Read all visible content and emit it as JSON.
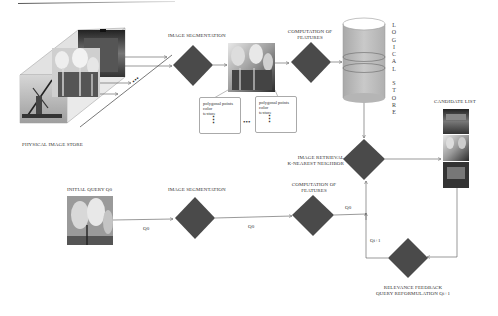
{
  "diagram": {
    "colors": {
      "diamond": "#4a4a4a",
      "cylinder": "#bdbdbd",
      "line": "#555555",
      "text": "#333333"
    },
    "physical_store": {
      "label": "PHYSICAL IMAGE STORE",
      "images": [
        "windmill-photo",
        "tulips-photo",
        "house-photo"
      ],
      "dots": "•••"
    },
    "top_row": {
      "segmentation_label": "IMAGE SEGMENTATION",
      "features_label_line1": "COMPUTATION OF",
      "features_label_line2": "FEATURES",
      "feature_boxes": [
        {
          "lines": [
            "polygonal points",
            "color",
            "texture"
          ],
          "dots": "⋮"
        },
        {
          "lines": [
            "polygonal points",
            "color",
            "texture"
          ],
          "dots": "⋮"
        }
      ],
      "between_boxes_dots": "•••"
    },
    "logical_store": {
      "letters_top": [
        "L",
        "O",
        "G",
        "I",
        "C",
        "A",
        "L"
      ],
      "letters_bottom": [
        "S",
        "T",
        "O",
        "R",
        "E"
      ]
    },
    "retrieval": {
      "label_line1": "IMAGE RETRIEVAL",
      "label_line2": "K-NEAREST NEIGHBOR"
    },
    "candidate_list": {
      "label": "CANDIDATE LIST",
      "images": [
        "building-photo",
        "tulips-photo",
        "house-photo"
      ]
    },
    "bottom_row": {
      "initial_query_label": "INITIAL QUERY Q0",
      "segmentation_label": "IMAGE SEGMENTATION",
      "features_label_line1": "COMPUTATION OF",
      "features_label_line2": "FEATURES",
      "edge_q0_a": "Q0",
      "edge_q0_b": "Q0",
      "edge_q0_c": "Q0",
      "edge_qi1": "Qi+1"
    },
    "feedback": {
      "label_line1": "RELEVANCE FEEDBACK",
      "label_line2": "QUERY REFORMULATION Qi+1"
    }
  }
}
